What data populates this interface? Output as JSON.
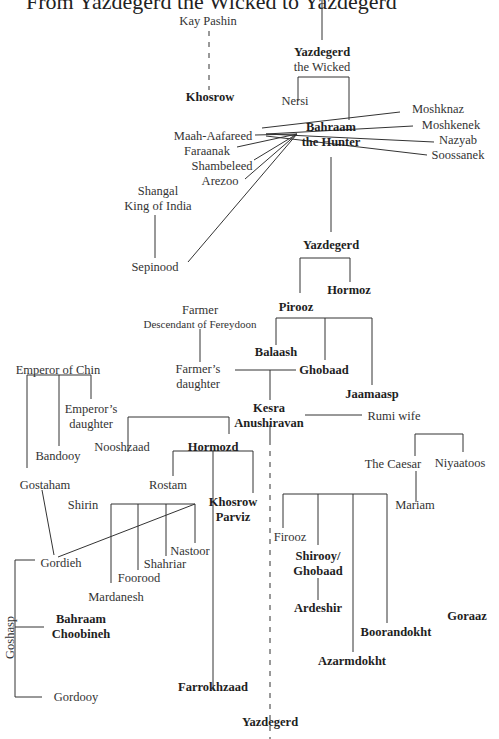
{
  "title": "From Yazdegerd the Wicked to Yazdegerd",
  "nodes": {
    "kay_pashin": "Kay Pashin",
    "khosrow": "Khosrow",
    "yazdegerd_wicked_1": "Yazdegerd",
    "yazdegerd_wicked_2": "the Wicked",
    "nersi": "Nersi",
    "bahraam_hunter_1": "Bahraam",
    "bahraam_hunter_2": "the Hunter",
    "maah_aafareed": "Maah-Aafareed",
    "faraanak": "Faraanak",
    "shambeleed": "Shambeleed",
    "arezoo": "Arezoo",
    "moshknaz": "Moshknaz",
    "moshkenek": "Moshkenek",
    "nazyab": "Nazyab",
    "soossanek": "Soossanek",
    "shangal_1": "Shangal",
    "shangal_2": "King of India",
    "sepinood": "Sepinood",
    "yazdegerd_2": "Yazdegerd",
    "hormoz": "Hormoz",
    "pirooz": "Pirooz",
    "farmer_1": "Farmer",
    "farmer_2": "Descendant of Fereydoon",
    "farmers_daughter_1": "Farmer’s",
    "farmers_daughter_2": "daughter",
    "balaash": "Balaash",
    "ghobaad": "Ghobaad",
    "jaamaasp": "Jaamaasp",
    "emperor_chin": "Emperor of Chin",
    "emperors_daughter_1": "Emperor’s",
    "emperors_daughter_2": "daughter",
    "kesra_1": "Kesra",
    "kesra_2": "Anushiravan",
    "rumi_wife": "Rumi wife",
    "bandooy": "Bandooy",
    "nooshzaad": "Nooshzaad",
    "hormozd": "Hormozd",
    "the_caesar": "The Caesar",
    "niyaatoos": "Niyaatoos",
    "gostaham": "Gostaham",
    "rostam": "Rostam",
    "shirin": "Shirin",
    "khosrow_parviz_1": "Khosrow",
    "khosrow_parviz_2": "Parviz",
    "mariam": "Mariam",
    "firooz": "Firooz",
    "nastoor": "Nastoor",
    "gordieh": "Gordieh",
    "shahriar": "Shahriar",
    "shirooy_1": "Shirooy/",
    "shirooy_2": "Ghobaad",
    "foorood": "Foorood",
    "mardanesh": "Mardanesh",
    "ardeshir": "Ardeshir",
    "goraaz": "Goraaz",
    "bahraam_choobineh_1": "Bahraam",
    "bahraam_choobineh_2": "Choobineh",
    "boorandokht": "Boorandokht",
    "goshasp": "Goshasp",
    "azarmdokht": "Azarmdokht",
    "farrokhzaad": "Farrokhzaad",
    "gordooy": "Gordooy",
    "yazdegerd_last": "Yazdegerd"
  }
}
